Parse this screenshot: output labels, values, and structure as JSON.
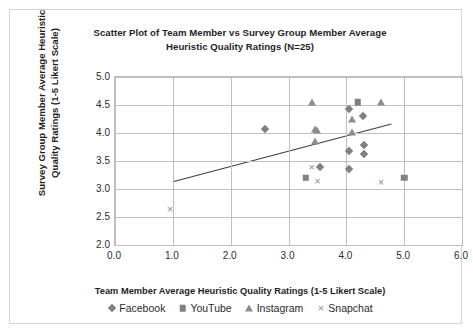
{
  "chart_data": {
    "type": "scatter",
    "title": "Scatter Plot of Team Member vs Survey Group Member Average Heuristic Quality Ratings (N=25)",
    "title_line1": "Scatter Plot of Team Member vs Survey Group Member Average",
    "title_line2": "Heuristic Quality Ratings (N=25)",
    "xlabel": "Team Member Average Heuristic Quality Ratings (1-5 Likert Scale)",
    "ylabel": "Survey Group Member Average Heuristic Quality Ratings (1-5 Likert Scale)",
    "ylabel_line1": "Survey Group Member Average Heuristic",
    "ylabel_line2": "Quality Ratings (1-5 Likert Scale)",
    "xlim": [
      0.0,
      6.0
    ],
    "ylim": [
      2.0,
      5.0
    ],
    "xticks": [
      "0.0",
      "1.0",
      "2.0",
      "3.0",
      "4.0",
      "5.0",
      "6.0"
    ],
    "yticks": [
      "5.0",
      "4.5",
      "4.0",
      "3.5",
      "3.0",
      "2.5",
      "2.0"
    ],
    "grid": true,
    "legend_position": "bottom",
    "marker_color": "#808080",
    "trendline": {
      "visible": true,
      "x0": 1.0,
      "y0": 3.13,
      "x1": 4.78,
      "y1": 4.16
    },
    "series": [
      {
        "name": "Facebook",
        "marker": "diamond",
        "points": [
          [
            2.6,
            4.07
          ],
          [
            4.05,
            4.43
          ],
          [
            4.28,
            4.3
          ],
          [
            4.3,
            3.78
          ],
          [
            4.3,
            3.63
          ],
          [
            4.05,
            3.68
          ],
          [
            4.05,
            3.35
          ],
          [
            3.55,
            3.39
          ]
        ]
      },
      {
        "name": "YouTube",
        "marker": "square",
        "points": [
          [
            4.2,
            4.55
          ],
          [
            3.3,
            3.2
          ],
          [
            5.0,
            3.2
          ]
        ]
      },
      {
        "name": "Instagram",
        "marker": "triangle",
        "points": [
          [
            3.4,
            4.55
          ],
          [
            4.6,
            4.55
          ],
          [
            4.1,
            4.25
          ],
          [
            3.45,
            4.07
          ],
          [
            3.5,
            4.05
          ],
          [
            4.1,
            4.02
          ],
          [
            3.45,
            3.85
          ]
        ]
      },
      {
        "name": "Snapchat",
        "marker": "cross",
        "points": [
          [
            0.95,
            2.65
          ],
          [
            3.4,
            3.4
          ],
          [
            3.5,
            3.14
          ],
          [
            4.6,
            3.12
          ]
        ]
      }
    ]
  },
  "legend": {
    "items": [
      {
        "label": "Facebook",
        "marker": "diamond"
      },
      {
        "label": "YouTube",
        "marker": "square"
      },
      {
        "label": "Instagram",
        "marker": "triangle"
      },
      {
        "label": "Snapchat",
        "marker": "cross"
      }
    ]
  }
}
